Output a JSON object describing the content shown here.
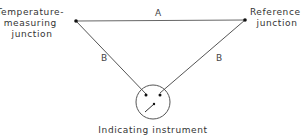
{
  "diagram": {
    "type": "thermocouple-circuit",
    "nodes": {
      "measuring_junction": {
        "label_lines": [
          "Temperature-",
          "measuring",
          "junction"
        ],
        "x": 76,
        "y": 21
      },
      "reference_junction": {
        "label_lines": [
          "Reference",
          "junction"
        ],
        "x": 245,
        "y": 20
      },
      "instrument": {
        "label": "Indicating instrument",
        "cx": 153,
        "cy": 102,
        "r": 17
      }
    },
    "wires": [
      {
        "label": "A",
        "from": "measuring_junction",
        "to": "reference_junction"
      },
      {
        "label": "B",
        "from": "measuring_junction",
        "to": "instrument"
      },
      {
        "label": "B",
        "from": "reference_junction",
        "to": "instrument"
      }
    ],
    "colors": {
      "line": "#555555",
      "text": "#333333",
      "background": "#ffffff"
    }
  }
}
